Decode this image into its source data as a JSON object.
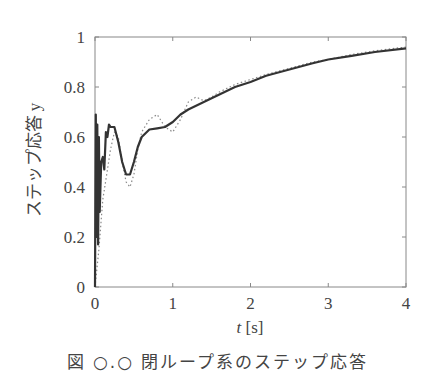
{
  "chart_data": {
    "type": "line",
    "title": "",
    "xlabel": "t [s]",
    "ylabel": "ステップ応答 y",
    "xlim": [
      0,
      4
    ],
    "ylim": [
      0,
      1
    ],
    "xticks": [
      "0",
      "1",
      "2",
      "3",
      "4"
    ],
    "yticks": [
      "0",
      "0.2",
      "0.4",
      "0.6",
      "0.8",
      "1"
    ],
    "grid": false,
    "legend": null,
    "series": [
      {
        "name": "solid",
        "style": "solid",
        "color": "#333333",
        "x": [
          0.0,
          0.01,
          0.02,
          0.03,
          0.04,
          0.05,
          0.06,
          0.08,
          0.1,
          0.12,
          0.14,
          0.16,
          0.18,
          0.2,
          0.25,
          0.3,
          0.35,
          0.4,
          0.45,
          0.5,
          0.55,
          0.6,
          0.7,
          0.8,
          0.9,
          1.0,
          1.1,
          1.2,
          1.4,
          1.6,
          1.8,
          2.0,
          2.2,
          2.5,
          2.8,
          3.0,
          3.3,
          3.6,
          4.0
        ],
        "y": [
          0.0,
          0.69,
          0.2,
          0.65,
          0.17,
          0.6,
          0.3,
          0.5,
          0.52,
          0.47,
          0.62,
          0.6,
          0.65,
          0.64,
          0.64,
          0.58,
          0.5,
          0.45,
          0.45,
          0.5,
          0.56,
          0.6,
          0.63,
          0.635,
          0.64,
          0.66,
          0.69,
          0.71,
          0.74,
          0.77,
          0.8,
          0.82,
          0.845,
          0.87,
          0.895,
          0.91,
          0.925,
          0.94,
          0.955
        ]
      },
      {
        "name": "dotted",
        "style": "dotted",
        "color": "#888888",
        "x": [
          0.0,
          0.05,
          0.1,
          0.15,
          0.2,
          0.25,
          0.3,
          0.35,
          0.4,
          0.45,
          0.5,
          0.55,
          0.6,
          0.7,
          0.8,
          0.9,
          1.0,
          1.1,
          1.2,
          1.3,
          1.4,
          1.5,
          1.6,
          1.8,
          2.0,
          2.2,
          2.5,
          2.8,
          3.0,
          3.3,
          3.6,
          4.0
        ],
        "y": [
          0.0,
          0.15,
          0.35,
          0.45,
          0.55,
          0.62,
          0.6,
          0.5,
          0.42,
          0.4,
          0.45,
          0.55,
          0.62,
          0.67,
          0.69,
          0.64,
          0.62,
          0.67,
          0.74,
          0.76,
          0.745,
          0.76,
          0.78,
          0.81,
          0.83,
          0.85,
          0.875,
          0.9,
          0.91,
          0.93,
          0.945,
          0.96
        ]
      }
    ]
  },
  "figure": {
    "caption": "図 ○.○ 閉ループ系のステップ応答"
  }
}
